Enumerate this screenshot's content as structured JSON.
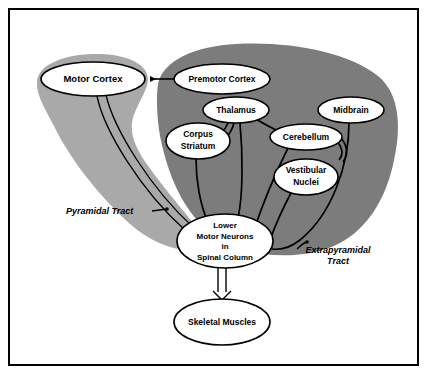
{
  "diagram": {
    "colors": {
      "background": "#ffffff",
      "frame": "#000000",
      "light_lobe": "#a9a9a9",
      "dark_mass": "#7c7c7c",
      "node_fill": "#ffffff",
      "stroke": "#000000"
    },
    "regions": [
      {
        "id": "pyramidal-lobe",
        "name": "pyramidal-system-lobe",
        "shade": "light"
      },
      {
        "id": "extrapyramidal-mass",
        "name": "extrapyramidal-system-mass",
        "shade": "dark"
      }
    ],
    "nodes": [
      {
        "id": "motor-cortex",
        "label": "Motor Cortex",
        "lines": [
          "Motor Cortex"
        ],
        "cx": 93,
        "cy": 79,
        "rx": 52,
        "ry": 17,
        "font": 9.5
      },
      {
        "id": "premotor-cortex",
        "label": "Premotor Cortex",
        "lines": [
          "Premotor Cortex"
        ],
        "cx": 222,
        "cy": 79,
        "rx": 48,
        "ry": 15,
        "font": 8.5
      },
      {
        "id": "thalamus",
        "label": "Thalamus",
        "lines": [
          "Thalamus"
        ],
        "cx": 236,
        "cy": 110,
        "rx": 33,
        "ry": 13,
        "font": 8.5
      },
      {
        "id": "midbrain",
        "label": "Midbrain",
        "lines": [
          "Midbrain"
        ],
        "cx": 351,
        "cy": 110,
        "rx": 33,
        "ry": 13,
        "font": 8.5
      },
      {
        "id": "corpus-striatum",
        "label": "Corpus Striatum",
        "lines": [
          "Corpus",
          "Striatum"
        ],
        "cx": 198,
        "cy": 141,
        "rx": 32,
        "ry": 18,
        "font": 8.5
      },
      {
        "id": "cerebellum",
        "label": "Cerebellum",
        "lines": [
          "Cerebellum"
        ],
        "cx": 306,
        "cy": 137,
        "rx": 36,
        "ry": 13,
        "font": 8.5
      },
      {
        "id": "vestibular-nuclei",
        "label": "Vestibular Nuclei",
        "lines": [
          "Vestibular",
          "Nuclei"
        ],
        "cx": 306,
        "cy": 177,
        "rx": 32,
        "ry": 18,
        "font": 8.5
      },
      {
        "id": "lower-motor-neurons",
        "label": "Lower Motor Neurons in Spinal Column",
        "lines": [
          "Lower",
          "Motor Neurons",
          "in",
          "Spinal Column"
        ],
        "cx": 225,
        "cy": 241,
        "rx": 48,
        "ry": 27,
        "font": 8
      },
      {
        "id": "skeletal-muscles",
        "label": "Skeletal Muscles",
        "lines": [
          "Skeletal Muscles"
        ],
        "cx": 222,
        "cy": 322,
        "rx": 48,
        "ry": 23,
        "font": 8.5
      }
    ],
    "tract_labels": [
      {
        "id": "pyramidal-tract",
        "lines": [
          "Pyramidal Tract"
        ],
        "x": 66,
        "y": 214,
        "anchor": "start",
        "font": 9
      },
      {
        "id": "extrapyramidal-tract",
        "lines": [
          "Extrapyramidal",
          "Tract"
        ],
        "x": 338,
        "y": 253,
        "anchor": "middle",
        "font": 9
      }
    ],
    "connections": [
      {
        "id": "premotor-to-motor",
        "from": "premotor-cortex",
        "to": "motor-cortex",
        "style": "solid-arrow"
      },
      {
        "id": "motor-cortex-to-lmn",
        "from": "motor-cortex",
        "to": "lower-motor-neurons",
        "style": "hollow-band"
      },
      {
        "id": "corpus-striatum-to-lmn",
        "from": "corpus-striatum",
        "to": "lower-motor-neurons",
        "style": "curve"
      },
      {
        "id": "thalamus-to-corpus-striatum",
        "from": "thalamus",
        "to": "corpus-striatum",
        "style": "curve"
      },
      {
        "id": "thalamus-to-lmn",
        "from": "thalamus",
        "to": "lower-motor-neurons",
        "style": "curve"
      },
      {
        "id": "cerebellum-to-thalamus",
        "from": "cerebellum",
        "to": "thalamus",
        "style": "curve"
      },
      {
        "id": "cerebellum-to-lmn",
        "from": "cerebellum",
        "to": "lower-motor-neurons",
        "style": "curve"
      },
      {
        "id": "vestibular-nuclei-to-lmn",
        "from": "vestibular-nuclei",
        "to": "lower-motor-neurons",
        "style": "curve"
      },
      {
        "id": "midbrain-to-lmn",
        "from": "midbrain",
        "to": "lower-motor-neurons",
        "style": "curve"
      },
      {
        "id": "lmn-to-skeletal-muscles",
        "from": "lower-motor-neurons",
        "to": "skeletal-muscles",
        "style": "hollow-arrow"
      }
    ]
  }
}
